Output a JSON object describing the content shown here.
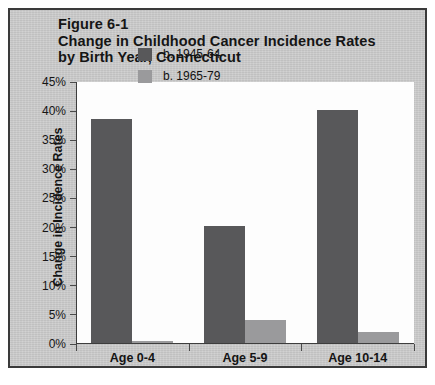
{
  "figure": {
    "title_lines": [
      "Figure 6-1",
      "Change in Childhood Cancer Incidence Rates",
      "by Birth Year, Connecticut"
    ]
  },
  "colors": {
    "series_1945_64": "#58585a",
    "series_1965_79": "#9a9a9c",
    "frame_background": "#c8c8c8",
    "plot_background": "#fdfdfd",
    "axis": "#3d3d3d"
  },
  "chart_data": {
    "type": "bar",
    "title": "Figure 6-1 Change in Childhood Cancer Incidence Rates by Birth Year, Connecticut",
    "xlabel": "",
    "ylabel": "Change in Incidence Rates",
    "categories": [
      "Age 0-4",
      "Age 5-9",
      "Age 10-14"
    ],
    "series": [
      {
        "name": "b. 1945-64",
        "values": [
          38.7,
          20.3,
          40.2
        ]
      },
      {
        "name": "b. 1965-79",
        "values": [
          0.5,
          4.2,
          2.0
        ]
      }
    ],
    "ylim": [
      0,
      45
    ],
    "ytick_labels": [
      "0%",
      "5%",
      "10%",
      "15%",
      "20%",
      "25%",
      "30%",
      "35%",
      "40%",
      "45%"
    ],
    "ytick_values": [
      0,
      5,
      10,
      15,
      20,
      25,
      30,
      35,
      40,
      45
    ],
    "grid": false,
    "legend_position": "upper center inside plot",
    "value_unit": "percent"
  }
}
